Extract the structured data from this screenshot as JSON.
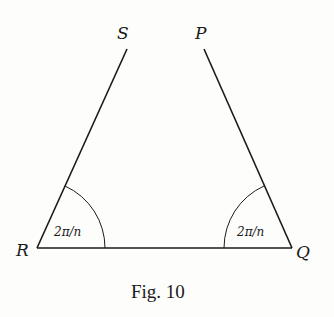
{
  "figure": {
    "caption": "Fig. 10",
    "vertices": {
      "S": "S",
      "P": "P",
      "R": "R",
      "Q": "Q"
    },
    "angles": {
      "R": "2π/n",
      "Q": "2π/n"
    },
    "colors": {
      "ink": "#1a1a1a",
      "paper": "#fdfdfb"
    }
  }
}
